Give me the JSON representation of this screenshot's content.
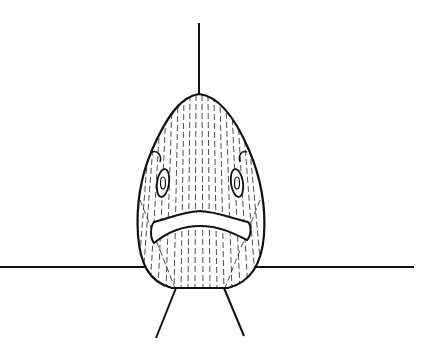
{
  "illustration": {
    "subject": "Front view line drawing of a fish head with frowning mouth",
    "ink_color": "#111111",
    "background_color": "#ffffff",
    "elements": {
      "body": "teardrop-shaped hatched fish body",
      "eyes": 2,
      "mouth": "downturned lips",
      "dorsal_line": "vertical line above body",
      "horizon_line": "horizontal line across image",
      "pelvic_fins": 2
    }
  }
}
